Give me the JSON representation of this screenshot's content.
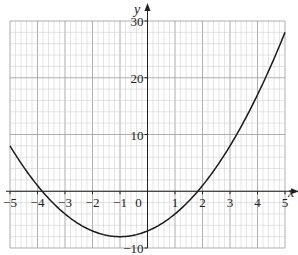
{
  "chart_data": {
    "type": "line",
    "title": "",
    "xlabel": "x",
    "ylabel": "y",
    "xlim": [
      -5,
      5
    ],
    "ylim": [
      -10,
      30
    ],
    "grid": true,
    "x_ticks": [
      -5,
      -4,
      -3,
      -2,
      -1,
      0,
      1,
      2,
      3,
      4,
      5
    ],
    "x_tick_labels": [
      "−5",
      "−4",
      "−3",
      "−2",
      "−1",
      "0",
      "1",
      "2",
      "3",
      "4",
      "5"
    ],
    "y_ticks": [
      -10,
      10,
      20,
      30
    ],
    "y_tick_labels": [
      "−10",
      "10",
      "20",
      "30"
    ],
    "series": [
      {
        "name": "y = x² + 2x − 7",
        "x": [
          -5,
          -4,
          -3,
          -2,
          -1,
          0,
          1,
          2,
          3,
          4,
          5
        ],
        "values": [
          8,
          1,
          -4,
          -7,
          -8,
          -7,
          -4,
          1,
          8,
          17,
          28
        ]
      }
    ],
    "colors": {
      "curve": "#1a1a1a",
      "grid_minor": "#c8c8c8",
      "grid_major": "#9a9a9a",
      "axis": "#222222"
    }
  }
}
